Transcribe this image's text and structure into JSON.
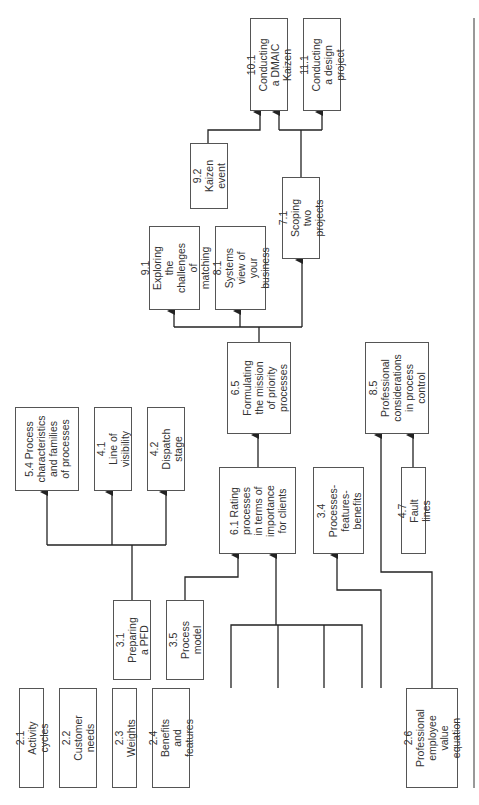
{
  "diagram": {
    "orientation": "rotated-90-ccw",
    "nodes": [
      {
        "id": "n21",
        "label": "2.1 Activity cycles",
        "x": 19,
        "y": 688,
        "w": 25,
        "h": 100
      },
      {
        "id": "n22",
        "label": "2.2 Customer\nneeds",
        "x": 59,
        "y": 688,
        "w": 38,
        "h": 100
      },
      {
        "id": "n23",
        "label": "2.3 Weights",
        "x": 112,
        "y": 688,
        "w": 25,
        "h": 100
      },
      {
        "id": "n24",
        "label": "2.4 Benefits and\nfeatures",
        "x": 152,
        "y": 688,
        "w": 38,
        "h": 100
      },
      {
        "id": "n26",
        "label": "2.6 Professional\nemployee value\nequation",
        "x": 406,
        "y": 688,
        "w": 52,
        "h": 100
      },
      {
        "id": "n31",
        "label": "3.1 Preparing\na PFD",
        "x": 113,
        "y": 600,
        "w": 38,
        "h": 80
      },
      {
        "id": "n35",
        "label": "3.5 Process\nmodel",
        "x": 166,
        "y": 600,
        "w": 38,
        "h": 80
      },
      {
        "id": "n54",
        "label": "5.4 Process\ncharacteristics\nand families\nof processes",
        "x": 15,
        "y": 407,
        "w": 64,
        "h": 84
      },
      {
        "id": "n41",
        "label": "4.1 Line of\nvisibility",
        "x": 94,
        "y": 407,
        "w": 38,
        "h": 84
      },
      {
        "id": "n42",
        "label": "4.2 Dispatch\nstage",
        "x": 147,
        "y": 407,
        "w": 38,
        "h": 84
      },
      {
        "id": "n61",
        "label": "6.1 Rating\nprocesses\nin terms of\nimportance\nfor clients",
        "x": 219,
        "y": 467,
        "w": 77,
        "h": 87
      },
      {
        "id": "n34",
        "label": "3.4 Processes-\nfeatures-\nbenefits",
        "x": 313,
        "y": 467,
        "w": 51,
        "h": 87
      },
      {
        "id": "n65",
        "label": "6.5 Formulating\nthe mission\nof priority\nprocesses",
        "x": 227,
        "y": 342,
        "w": 64,
        "h": 92
      },
      {
        "id": "n85",
        "label": "8.5 Professional\nconsiderations\nin process\ncontrol",
        "x": 365,
        "y": 342,
        "w": 64,
        "h": 92
      },
      {
        "id": "n47",
        "label": "4.7 Fault lines",
        "x": 401,
        "y": 467,
        "w": 25,
        "h": 87
      },
      {
        "id": "n91",
        "label": "9.1 Exploring\nthe challenges\nof matching",
        "x": 149,
        "y": 226,
        "w": 51,
        "h": 84
      },
      {
        "id": "n81",
        "label": "8.1 Systems\nview of your\nbusiness",
        "x": 215,
        "y": 226,
        "w": 51,
        "h": 84
      },
      {
        "id": "n71",
        "label": "7.1 Scoping\ntwo projects",
        "x": 282,
        "y": 177,
        "w": 38,
        "h": 82
      },
      {
        "id": "n92",
        "label": "9.2 Kaizen\nevent",
        "x": 190,
        "y": 143,
        "w": 38,
        "h": 66
      },
      {
        "id": "n101",
        "label": "10.1 Conducting\na DMAIC Kaizen",
        "x": 250,
        "y": 18,
        "w": 38,
        "h": 93
      },
      {
        "id": "n111",
        "label": "11.1 Conducting\na design project",
        "x": 303,
        "y": 18,
        "w": 38,
        "h": 93
      }
    ]
  },
  "style": {
    "line_color": "#222222",
    "border_color": "#555555",
    "text_color": "#333333"
  }
}
